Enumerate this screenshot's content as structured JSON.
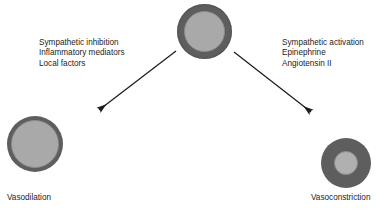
{
  "diagram": {
    "background_color": "#ffffff",
    "vessel_wall_color": "#5e5e5e",
    "vessel_lumen_color": "#a9a9a9",
    "text_color": "#1c1c1c",
    "nodes": {
      "normal_vessel": {
        "name": "normal-vessel",
        "label": "",
        "wall_thickness": "medium",
        "lumen": "medium"
      },
      "dilated_vessel": {
        "name": "dilated-vessel",
        "label": "Vasodilation",
        "wall_thickness": "thin",
        "lumen": "wide"
      },
      "constricted_vessel": {
        "name": "constricted-vessel",
        "label": "Vasoconstriction",
        "wall_thickness": "thick",
        "lumen": "narrow"
      }
    },
    "left_branch": {
      "heading": "",
      "factors": [
        "Sympathetic inhibition",
        "Inflammatory mediators",
        "Local factors"
      ],
      "arrow": {
        "from": "normal-vessel",
        "to": "dilated-vessel",
        "direction": "down-left"
      }
    },
    "right_branch": {
      "heading": "",
      "factors": [
        "Sympathetic activation",
        "Epinephrine",
        "Angiotensin II"
      ],
      "arrow": {
        "from": "normal-vessel",
        "to": "constricted-vessel",
        "direction": "down-right"
      }
    }
  }
}
